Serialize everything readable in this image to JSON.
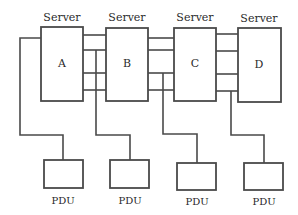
{
  "diagram": {
    "type": "server-power-topology",
    "servers": [
      {
        "id": "A",
        "header": "Server",
        "label": "A"
      },
      {
        "id": "B",
        "header": "Server",
        "label": "B"
      },
      {
        "id": "C",
        "header": "Server",
        "label": "C"
      },
      {
        "id": "D",
        "header": "Server",
        "label": "D"
      }
    ],
    "pdus": [
      {
        "label": "PDU"
      },
      {
        "label": "PDU"
      },
      {
        "label": "PDU"
      },
      {
        "label": "PDU"
      }
    ],
    "interconnects": [
      {
        "from": "A",
        "to": "B",
        "links": 4
      },
      {
        "from": "B",
        "to": "C",
        "links": 4
      },
      {
        "from": "C",
        "to": "D",
        "links": 4
      }
    ],
    "colors": {
      "line": "#4a4a4a",
      "text": "#2a2a2a",
      "background": "#ffffff"
    }
  }
}
